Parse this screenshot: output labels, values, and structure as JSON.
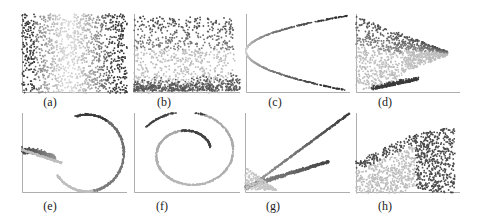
{
  "figure": {
    "panels": [
      {
        "id": "a",
        "caption": "(a)",
        "x": 22,
        "y": 14,
        "w": 105,
        "h": 79,
        "capx": 50,
        "capy": 95
      },
      {
        "id": "b",
        "caption": "(b)",
        "x": 134,
        "y": 14,
        "w": 106,
        "h": 79,
        "capx": 164,
        "capy": 95
      },
      {
        "id": "c",
        "caption": "(c)",
        "x": 246,
        "y": 14,
        "w": 104,
        "h": 79,
        "capx": 275,
        "capy": 95
      },
      {
        "id": "d",
        "caption": "(d)",
        "x": 356,
        "y": 14,
        "w": 104,
        "h": 79,
        "capx": 385,
        "capy": 95
      },
      {
        "id": "e",
        "caption": "(e)",
        "x": 22,
        "y": 113,
        "w": 105,
        "h": 80,
        "capx": 50,
        "capy": 199
      },
      {
        "id": "f",
        "caption": "(f)",
        "x": 134,
        "y": 113,
        "w": 106,
        "h": 80,
        "capx": 162,
        "capy": 199
      },
      {
        "id": "g",
        "caption": "(g)",
        "x": 245,
        "y": 113,
        "w": 105,
        "h": 80,
        "capx": 273,
        "capy": 199
      },
      {
        "id": "h",
        "caption": "(h)",
        "x": 356,
        "y": 113,
        "w": 104,
        "h": 80,
        "capx": 385,
        "capy": 199
      }
    ]
  },
  "chart_data": [
    {
      "type": "scatter",
      "title": "(a)",
      "shape": "uniform-rectangle",
      "color_gradient": "dark at left & right edges, light in middle",
      "grid": false
    },
    {
      "type": "scatter",
      "title": "(b)",
      "shape": "rectangle with dense bottom band",
      "color_gradient": "dark top, light middle, dark bottom band",
      "grid": false
    },
    {
      "type": "scatter",
      "title": "(c)",
      "shape": "sideways parabola opening right",
      "color_gradient": "light at vertex, dark toward arm ends",
      "grid": false
    },
    {
      "type": "scatter",
      "title": "(d)",
      "shape": "triangular wedge narrowing to right",
      "color_gradient": "dark top, light middle, dark dense bottom-left cluster",
      "grid": false
    },
    {
      "type": "scatter",
      "title": "(e)",
      "shape": "teardrop loop with left tail",
      "color_gradient": "dark tail & upper arc start, light lower arc",
      "grid": false
    },
    {
      "type": "scatter",
      "title": "(f)",
      "shape": "spiral (swiss roll projection)",
      "color_gradient": "dark inner end & outer left, light mid",
      "grid": false
    },
    {
      "type": "scatter",
      "title": "(g)",
      "shape": "two diverging lines from bottom-left",
      "color_gradient": "light near origin, dark along lines",
      "grid": false
    },
    {
      "type": "scatter",
      "title": "(h)",
      "shape": "tilted parallelogram band",
      "color_gradient": "dark upper-left edge & right, light center",
      "grid": false
    }
  ]
}
